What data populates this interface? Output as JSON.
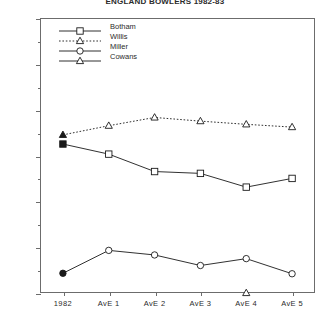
{
  "chart_data": {
    "type": "line",
    "title": "ENGLAND BOWLERS 1982-83",
    "xlabel": "",
    "ylabel": "",
    "categories": [
      "1982",
      "AvE 1",
      "AvE 2",
      "AvE 3",
      "AvE 4",
      "AvE 5"
    ],
    "ylim": [
      400,
      1000
    ],
    "ytick_labels": [
      "400",
      "500",
      "600",
      "700",
      "800",
      "900",
      "1000"
    ],
    "ytick_values": [
      400,
      500,
      600,
      700,
      800,
      900,
      1000
    ],
    "yminor_values": [
      450,
      550,
      650,
      750,
      850,
      950
    ],
    "grid": false,
    "legend_position": "top-left",
    "series": [
      {
        "name": "Botham",
        "marker": "square",
        "line_style": "solid",
        "color": "#1a1a1a",
        "values": [
          725,
          703,
          665,
          661,
          631,
          650
        ],
        "first_point_filled": true
      },
      {
        "name": "Willis",
        "marker": "triangle",
        "line_style": "dotted",
        "color": "#1a1a1a",
        "values": [
          745,
          765,
          783,
          775,
          768,
          762
        ],
        "first_point_filled": true
      },
      {
        "name": "Miller",
        "marker": "circle",
        "line_style": "solid",
        "color": "#1a1a1a",
        "values": [
          443,
          493,
          483,
          460,
          475,
          442
        ],
        "first_point_filled": true
      },
      {
        "name": "Cowans",
        "marker": "triangle-open",
        "line_style": "solid",
        "color": "#1a1a1a",
        "values": [
          null,
          null,
          null,
          null,
          400,
          null
        ],
        "first_point_filled": false
      }
    ]
  },
  "legend": {
    "items": [
      {
        "label": "Botham"
      },
      {
        "label": "Willis"
      },
      {
        "label": "Miller"
      },
      {
        "label": "Cowans"
      }
    ]
  }
}
